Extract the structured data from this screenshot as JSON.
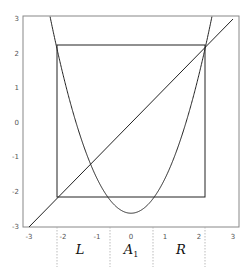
{
  "chart_data": {
    "type": "line",
    "title": "",
    "xlabel": "",
    "ylabel": "",
    "xlim": [
      -3,
      3
    ],
    "ylim": [
      -3,
      3
    ],
    "grid": false,
    "x_ticks": [
      "-3",
      "-2",
      "-1",
      "0",
      "1",
      "2",
      "3"
    ],
    "y_ticks": [
      "3",
      "2",
      "1",
      "0",
      "-1",
      "-2",
      "-3"
    ],
    "series": [
      {
        "name": "parabola",
        "expression": "y = x^2 - 2.6",
        "description": "upward parabola with vertex at (0, -2.6)"
      },
      {
        "name": "identity",
        "expression": "y = x",
        "description": "diagonal line from (-3,-3) to (3,3)"
      },
      {
        "name": "square",
        "expression": "box [-2.19, 2.19] x [-2.19, 2.19]",
        "description": "invariant square with corners at fixed points"
      }
    ],
    "region_boundaries": [
      -2.19,
      -0.64,
      0.64,
      2.19
    ],
    "region_labels": [
      {
        "text": "L",
        "x": -1.4
      },
      {
        "text": "A",
        "subscript": "1",
        "x": 0.0
      },
      {
        "text": "R",
        "x": 1.4
      }
    ]
  },
  "labels": {
    "L": "L",
    "A": "A",
    "A_sub": "1",
    "R": "R"
  }
}
